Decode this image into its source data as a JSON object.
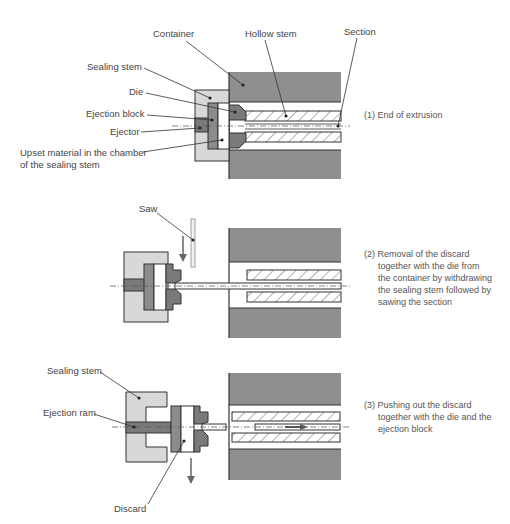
{
  "figure": {
    "stage1": {
      "labels": {
        "container": "Container",
        "hollow_stem": "Hollow stem",
        "section": "Section",
        "sealing_stem": "Sealing stem",
        "die": "Die",
        "ejection_block": "Ejection block",
        "ejector": "Ejector",
        "upset_line1": "Upset material in the chamber",
        "upset_line2": "of the sealing stem"
      },
      "caption": [
        "(1) End of extrusion"
      ]
    },
    "stage2": {
      "labels": {
        "saw": "Saw"
      },
      "caption": [
        "(2) Removal of the discard",
        "together with the die from",
        "the container by withdrawing",
        "the sealing stem followed by",
        "sawing the section"
      ]
    },
    "stage3": {
      "labels": {
        "sealing_stem": "Sealing stem",
        "ejection_ram": "Ejection ram",
        "discard": "Discard"
      },
      "caption": [
        "(3) Pushing out the discard",
        "together with the die and the",
        "ejection block"
      ]
    }
  }
}
